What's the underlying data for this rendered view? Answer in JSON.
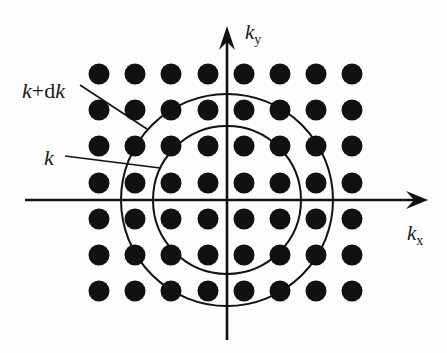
{
  "diagram": {
    "type": "k-space lattice with spherical shell",
    "colors": {
      "ink": "#111111",
      "background": "#fdfdfd"
    },
    "axes": {
      "origin": [
        227,
        200
      ],
      "x_axis": {
        "label_main": "k",
        "label_sub": "x",
        "from": [
          25,
          200
        ],
        "to": [
          428,
          200
        ]
      },
      "y_axis": {
        "label_main": "k",
        "label_sub": "y",
        "from": [
          227,
          340
        ],
        "to": [
          227,
          26
        ]
      }
    },
    "lattice": {
      "columns_x": [
        99,
        135,
        171,
        208,
        244,
        280,
        316,
        352
      ],
      "rows_y": [
        74,
        110,
        146,
        183,
        219,
        255,
        291
      ],
      "dot_radius": 10.5
    },
    "circles": [
      {
        "name": "inner",
        "label": "k",
        "radius": 74
      },
      {
        "name": "outer",
        "label": "k+dk",
        "radius": 106
      }
    ],
    "annotations": [
      {
        "text_parts": [
          "k",
          "+d",
          "k"
        ],
        "label": "k+dk",
        "text_pos": [
          22,
          98
        ],
        "line": [
          [
            80,
            85
          ],
          [
            147,
            129
          ]
        ]
      },
      {
        "text_parts": [
          "k"
        ],
        "label": "k",
        "text_pos": [
          44,
          165
        ],
        "line": [
          [
            65,
            156
          ],
          [
            160,
            168
          ]
        ]
      }
    ]
  }
}
